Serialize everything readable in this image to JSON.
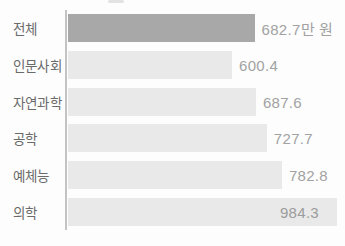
{
  "chart_data": {
    "type": "bar",
    "orientation": "horizontal",
    "title": "",
    "xlabel": "",
    "ylabel": "",
    "unit": "만 원",
    "categories": [
      "전체",
      "인문사회",
      "자연과학",
      "공학",
      "예체능",
      "의학"
    ],
    "values": [
      682.7,
      600.4,
      687.6,
      727.7,
      782.8,
      984.3
    ],
    "value_labels": [
      "682.7만 원",
      "600.4",
      "687.6",
      "727.7",
      "782.8",
      "984.3"
    ],
    "xlim": [
      0,
      984.3
    ],
    "highlight_index": 0,
    "inside_label_index": 5,
    "grid": false,
    "legend": false,
    "colors": {
      "highlight_bar": "#a8a8a8",
      "bar": "#e9e9e9",
      "axis_line": "#c3c3c3",
      "category_text": "#6a6a6a",
      "value_text": "#a2a2a2",
      "background": "#fdfdfd"
    }
  }
}
